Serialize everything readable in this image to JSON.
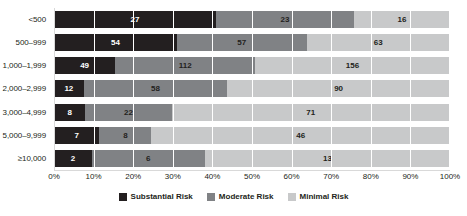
{
  "chart_data": {
    "type": "bar",
    "subtype": "horizontal-stacked-100-percent",
    "title": "",
    "xlabel": "",
    "ylabel": "",
    "categories": [
      "<500",
      "500–999",
      "1,000–1,999",
      "2,000–2,999",
      "3,000–4,999",
      "5,000–9,999",
      "≥10,000"
    ],
    "series": [
      {
        "name": "Substantial Risk",
        "color": "#231f20",
        "values": [
          27,
          54,
          49,
          12,
          8,
          7,
          2
        ]
      },
      {
        "name": "Moderate Risk",
        "color": "#808285",
        "values": [
          23,
          57,
          112,
          58,
          22,
          8,
          6
        ]
      },
      {
        "name": "Minimal Risk",
        "color": "#c8c9ca",
        "values": [
          16,
          63,
          156,
          90,
          71,
          46,
          13
        ]
      }
    ],
    "row_totals": [
      66,
      174,
      317,
      160,
      101,
      61,
      21
    ],
    "xticks": [
      "0%",
      "10%",
      "20%",
      "30%",
      "40%",
      "50%",
      "60%",
      "70%",
      "80%",
      "90%",
      "100%"
    ],
    "xtick_values": [
      0,
      10,
      20,
      30,
      40,
      50,
      60,
      70,
      80,
      90,
      100
    ],
    "xlim": [
      0,
      100
    ],
    "grid": true,
    "legend_position": "bottom"
  },
  "legend": {
    "items": [
      {
        "label": "Substantial Risk",
        "key": "substantial"
      },
      {
        "label": "Moderate Risk",
        "key": "moderate"
      },
      {
        "label": "Minimal Risk",
        "key": "minimal"
      }
    ]
  }
}
